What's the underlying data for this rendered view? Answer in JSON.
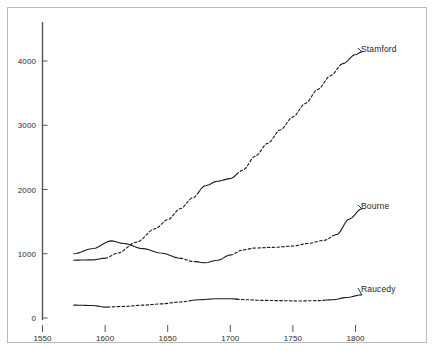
{
  "chart_data": {
    "type": "line",
    "title": "",
    "subtitle": "",
    "xlabel": "",
    "ylabel": "",
    "xlim": [
      1550,
      1810
    ],
    "ylim": [
      0,
      4400
    ],
    "grid": false,
    "legend_position": "inline-right-end-labels",
    "xticks": [
      1550,
      1600,
      1650,
      1700,
      1750,
      1800
    ],
    "xticklabels": [
      "1550",
      "1600",
      "1650",
      "1700",
      "1750",
      "1800"
    ],
    "yticks": [
      0,
      1000,
      2000,
      3000,
      4000
    ],
    "yticklabels": [
      "0",
      "1000",
      "2000",
      "3000",
      "4000"
    ],
    "series": [
      {
        "name": "Stamford",
        "label": "Stamford",
        "color": "#1a1a1a",
        "x": [
          1575,
          1590,
          1600,
          1610,
          1625,
          1640,
          1650,
          1660,
          1670,
          1680,
          1690,
          1700,
          1710,
          1720,
          1730,
          1740,
          1750,
          1760,
          1770,
          1780,
          1790,
          1800,
          1805
        ],
        "values": [
          900,
          905,
          930,
          1010,
          1180,
          1390,
          1530,
          1700,
          1870,
          2060,
          2130,
          2170,
          2300,
          2520,
          2720,
          2930,
          3130,
          3340,
          3560,
          3770,
          3960,
          4100,
          4140
        ],
        "segments": [
          {
            "style": "solid",
            "x_from": 1575,
            "x_to": 1600
          },
          {
            "style": "dashed",
            "x_from": 1600,
            "x_to": 1675
          },
          {
            "style": "solid",
            "x_from": 1675,
            "x_to": 1705
          },
          {
            "style": "dashed",
            "x_from": 1705,
            "x_to": 1788
          },
          {
            "style": "solid",
            "x_from": 1788,
            "x_to": 1805
          }
        ]
      },
      {
        "name": "Bourne",
        "label": "Bourne",
        "color": "#1a1a1a",
        "x": [
          1575,
          1590,
          1605,
          1615,
          1630,
          1645,
          1660,
          1670,
          1680,
          1690,
          1700,
          1710,
          1720,
          1735,
          1750,
          1762,
          1775,
          1785,
          1795,
          1805
        ],
        "values": [
          1000,
          1080,
          1200,
          1160,
          1080,
          1010,
          930,
          880,
          860,
          900,
          980,
          1060,
          1090,
          1100,
          1120,
          1160,
          1210,
          1300,
          1540,
          1700
        ],
        "segments": [
          {
            "style": "solid",
            "x_from": 1575,
            "x_to": 1660
          },
          {
            "style": "dashed",
            "x_from": 1660,
            "x_to": 1672
          },
          {
            "style": "solid",
            "x_from": 1672,
            "x_to": 1700
          },
          {
            "style": "dashed",
            "x_from": 1700,
            "x_to": 1782
          },
          {
            "style": "solid",
            "x_from": 1782,
            "x_to": 1805
          }
        ]
      },
      {
        "name": "Raucedy",
        "label": "Raucedy",
        "color": "#1a1a1a",
        "x": [
          1575,
          1590,
          1600,
          1615,
          1630,
          1645,
          1660,
          1675,
          1690,
          1700,
          1712,
          1725,
          1740,
          1755,
          1770,
          1782,
          1793,
          1805
        ],
        "values": [
          200,
          195,
          170,
          180,
          200,
          220,
          250,
          285,
          300,
          300,
          285,
          275,
          270,
          265,
          270,
          285,
          320,
          360
        ],
        "segments": [
          {
            "style": "solid",
            "x_from": 1575,
            "x_to": 1602
          },
          {
            "style": "dashed",
            "x_from": 1602,
            "x_to": 1668
          },
          {
            "style": "solid",
            "x_from": 1668,
            "x_to": 1705
          },
          {
            "style": "dashed",
            "x_from": 1705,
            "x_to": 1775
          },
          {
            "style": "solid",
            "x_from": 1775,
            "x_to": 1805
          }
        ]
      }
    ],
    "annotations": [
      {
        "text": "Stamford",
        "x": 1805,
        "y": 4140
      },
      {
        "text": "Bourne",
        "x": 1805,
        "y": 1700
      },
      {
        "text": "Raucedy",
        "x": 1805,
        "y": 360
      }
    ]
  },
  "axis": {
    "y_label_0": "0",
    "y_label_1000": "1000",
    "y_label_2000": "2000",
    "y_label_3000": "3000",
    "y_label_4000": "4000",
    "x_label_1550": "1550",
    "x_label_1600": "1600",
    "x_label_1650": "1650",
    "x_label_1700": "1700",
    "x_label_1750": "1750",
    "x_label_1800": "1800"
  },
  "labels": {
    "stamford": "Stamford",
    "bourne": "Bourne",
    "raucedy": "Raucedy"
  },
  "colors": {
    "line": "#1a1a1a",
    "axis": "#555555",
    "frame": "#b9b9b9",
    "text": "#2b2b2b",
    "background": "#ffffff"
  }
}
